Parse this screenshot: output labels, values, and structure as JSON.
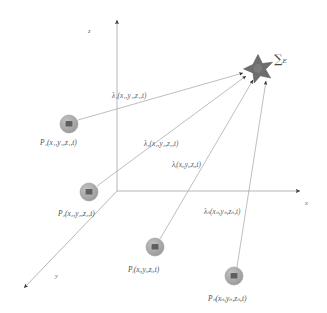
{
  "figure": {
    "type": "3d-coordinate-diagram",
    "background_color": "#ffffff",
    "line_color": "#9a9a9a",
    "node_fill_color": "#a8a8a8",
    "node_marker_color": "#5a5a5a",
    "star_color": "#666666",
    "text_color": "#5a5a5a"
  },
  "axes": [
    {
      "name": "z",
      "label": "z",
      "direction": "up",
      "label_x": 88,
      "label_y": 28
    },
    {
      "name": "x",
      "label": "x",
      "direction": "right",
      "label_x": 305,
      "label_y": 200
    },
    {
      "name": "y",
      "label": "y",
      "direction": "lower-left",
      "label_x": 55,
      "label_y": 273
    }
  ],
  "origin": {
    "x": 117,
    "y": 191
  },
  "receiver": {
    "name": "energy-sum-receiver",
    "shape": "six-pointed-star",
    "x": 258,
    "y": 68,
    "label_sum": "∑",
    "label_sub": "E",
    "label_x": 274,
    "label_y": 56
  },
  "nodes": [
    {
      "id": "P1",
      "label_prefix": "P",
      "label_sub": "1",
      "label_args": "(x₁,y₁,z₁,t)",
      "label_full": "P₁(x₁,y₁,z₁,t)",
      "cx": 69,
      "cy": 124,
      "r": 9,
      "label_x": 40,
      "label_y": 139
    },
    {
      "id": "P2",
      "label_prefix": "P",
      "label_sub": "2",
      "label_args": "(x₂,y₂,z₂,t)",
      "label_full": "P₂(x₂,y₂,z₂,t)",
      "cx": 89,
      "cy": 192,
      "r": 9,
      "label_x": 58,
      "label_y": 210
    },
    {
      "id": "Pi",
      "label_prefix": "P",
      "label_sub": "i",
      "label_args": "(xᵢ,yᵢ,zᵢ,t)",
      "label_full": "Pᵢ(xᵢ,yᵢ,zᵢ,t)",
      "cx": 155,
      "cy": 247,
      "r": 9,
      "label_x": 128,
      "label_y": 266
    },
    {
      "id": "Pn",
      "label_prefix": "P",
      "label_sub": "n",
      "label_args": "(xₙ,yₙ,zₙ,t)",
      "label_full": "Pₙ(xₙ,yₙ,zₙ,t)",
      "cx": 234,
      "cy": 276,
      "r": 9,
      "label_x": 208,
      "label_y": 295
    }
  ],
  "rays": [
    {
      "id": "lambda1",
      "from": "P1",
      "to": "receiver",
      "label": "λ₁(x₁,y₁,z₁,t)",
      "label_x": 112,
      "label_y": 97
    },
    {
      "id": "lambda2",
      "from": "P2",
      "to": "receiver",
      "label": "λ₂(x₂,y₂,z₂,t)",
      "label_x": 144,
      "label_y": 145
    },
    {
      "id": "lambda3",
      "from": "Pi",
      "to": "receiver",
      "label": "λᵢ(xᵢ,yᵢ,zᵢ,t)",
      "label_x": 172,
      "label_y": 166
    },
    {
      "id": "lambdan",
      "from": "Pn",
      "to": "receiver",
      "label": "λₙ(xₙ,yₙ,zₙ,t)",
      "label_x": 204,
      "label_y": 213
    }
  ]
}
